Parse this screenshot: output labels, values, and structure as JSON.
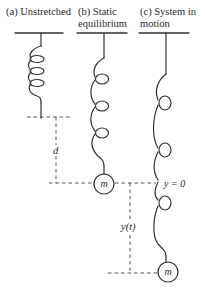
{
  "diagram": {
    "panels": [
      {
        "id": "a",
        "title_line1": "(a) Unstretched",
        "title_line2": ""
      },
      {
        "id": "b",
        "title_line1": "(b) Static",
        "title_line2": "equilibrium"
      },
      {
        "id": "c",
        "title_line1": "(c) System in",
        "title_line2": "motion"
      }
    ],
    "mass_label": "m",
    "labels": {
      "stretch": "d",
      "equilibrium": "y = 0",
      "displacement": "y(t)"
    },
    "colors": {
      "stroke": "#333333",
      "text": "#2a2a2a",
      "background": "#ffffff"
    }
  }
}
